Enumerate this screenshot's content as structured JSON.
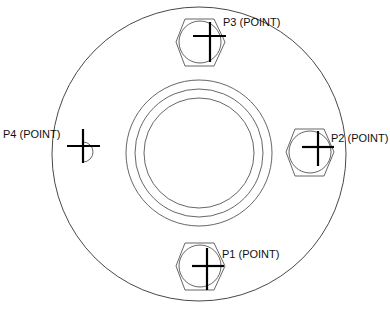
{
  "diagram": {
    "type": "flange-drawing",
    "outer_circle": {
      "cx": 199,
      "cy": 154,
      "r": 148
    },
    "bore_rings": [
      {
        "cx": 199,
        "cy": 153,
        "r": 73
      },
      {
        "cx": 199,
        "cy": 153,
        "r": 64
      },
      {
        "cx": 199,
        "cy": 153,
        "r": 55
      }
    ],
    "points": [
      {
        "id": "P1",
        "label": "P1 (POINT)",
        "cx": 200,
        "cy": 266,
        "has_hex": true
      },
      {
        "id": "P2",
        "label": "P2 (POINT)",
        "cx": 310,
        "cy": 152,
        "has_hex": true
      },
      {
        "id": "P3",
        "label": "P3 (POINT)",
        "cx": 200,
        "cy": 43,
        "has_hex": true
      },
      {
        "id": "P4",
        "label": "P4 (POINT)",
        "cx": 90,
        "cy": 153,
        "has_hex": false
      }
    ],
    "colors": {
      "line": "#555555",
      "cross": "#000000",
      "text": "#111111"
    }
  }
}
